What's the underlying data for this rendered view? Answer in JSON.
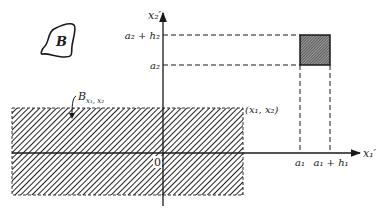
{
  "diagram": {
    "type": "coordinate-region-diagram",
    "axes": {
      "horizontal_label": "x₁′",
      "vertical_label": "x₂′",
      "origin_label": "0"
    },
    "set_B": {
      "label": "B"
    },
    "region": {
      "label_main": "B",
      "label_sub": "x₁, x₂",
      "corner_point_label": "(x₁, x₂)"
    },
    "square": {
      "x_ticks": [
        "a₁",
        "a₁ + h₁"
      ],
      "y_ticks": [
        "a₂ + h₂",
        "a₂"
      ]
    },
    "colors": {
      "ink": "#1a1a1a",
      "background": "#ffffff"
    }
  }
}
